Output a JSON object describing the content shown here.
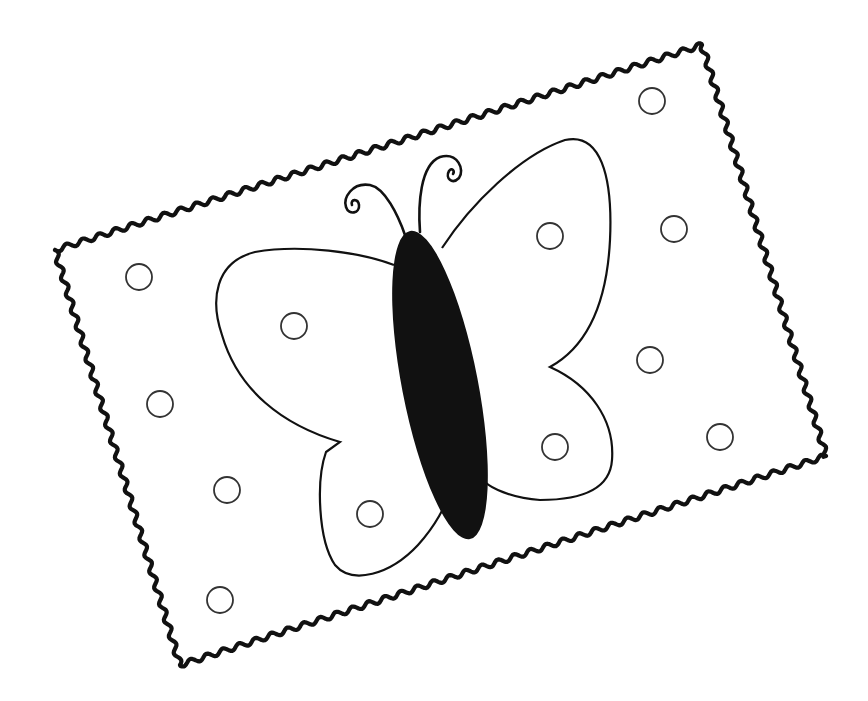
{
  "illustration": {
    "subject": "butterfly coloring page",
    "background": "#ffffff",
    "ink": "#111111",
    "circle_stroke": "#333333",
    "border": {
      "style": "wavy-rickrack",
      "corners": [
        [
          55,
          250
        ],
        [
          702,
          45
        ],
        [
          826,
          456
        ],
        [
          180,
          665
        ]
      ],
      "wave_amplitude": 2.6,
      "wave_period": 17,
      "stroke_width": 4.2
    },
    "butterfly": {
      "body": {
        "cx": 440,
        "cy": 385,
        "rx": 38,
        "ry": 157,
        "rotate": -11,
        "fill": "#111111"
      },
      "wings": {
        "upper_left": "M 394 265 C 360 252 300 244 255 252 C 215 262 210 300 222 335 C 238 390 282 425 340 442 L 326 452 C 316 480 318 540 335 565 C 352 585 390 575 418 545 C 436 525 446 505 448 495",
        "upper_right": "M 442 248 C 470 205 520 155 565 140 C 600 132 613 175 610 240 C 607 300 590 345 550 367 C 590 385 615 420 612 460 C 610 490 580 500 540 500 C 510 498 490 487 485 482"
      },
      "antennae": {
        "left": "M 405 235 C 398 215 385 188 370 185 C 352 182 343 198 346 207 C 349 216 360 213 359 205 C 358 198 350 199 352 205",
        "right": "M 420 232 C 418 205 420 165 440 157 C 458 152 465 170 459 178 C 452 185 445 178 449 171 C 452 167 455 171 453 174"
      }
    },
    "circles": [
      {
        "cx": 139,
        "cy": 277,
        "r": 13
      },
      {
        "cx": 160,
        "cy": 404,
        "r": 13
      },
      {
        "cx": 227,
        "cy": 490,
        "r": 13
      },
      {
        "cx": 220,
        "cy": 600,
        "r": 13
      },
      {
        "cx": 294,
        "cy": 326,
        "r": 13
      },
      {
        "cx": 370,
        "cy": 514,
        "r": 13
      },
      {
        "cx": 550,
        "cy": 236,
        "r": 13
      },
      {
        "cx": 555,
        "cy": 447,
        "r": 13
      },
      {
        "cx": 652,
        "cy": 101,
        "r": 13
      },
      {
        "cx": 674,
        "cy": 229,
        "r": 13
      },
      {
        "cx": 650,
        "cy": 360,
        "r": 13
      },
      {
        "cx": 720,
        "cy": 437,
        "r": 13
      }
    ]
  }
}
